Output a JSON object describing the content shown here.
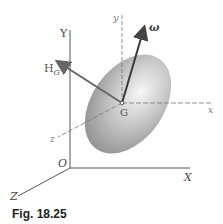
{
  "figure": {
    "caption": "Fig. 18.25",
    "labels": {
      "Y_axis": "Y",
      "X_axis": "X",
      "Z_axis": "Z",
      "origin": "O",
      "y_body": "y",
      "x_body": "x",
      "z_body": "z",
      "center": "G",
      "omega": "ω",
      "H_main": "H",
      "H_sub": "G"
    },
    "colors": {
      "axis": "#555555",
      "arrow": "#444444",
      "ellipsoid_light": "#f2f2f2",
      "ellipsoid_dark": "#8a8a8a"
    }
  }
}
